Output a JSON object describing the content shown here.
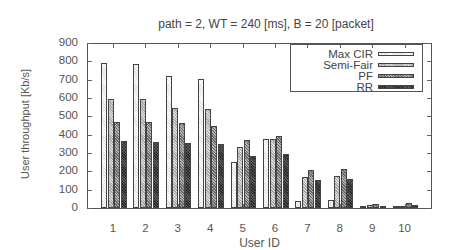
{
  "chart_data": {
    "type": "bar",
    "title": "path = 2, WT = 240 [ms], B = 20 [packet]",
    "xlabel": "User ID",
    "ylabel": "User throughput [Kb/s]",
    "ylim": [
      0,
      900
    ],
    "yticks": [
      0,
      100,
      200,
      300,
      400,
      500,
      600,
      700,
      800,
      900
    ],
    "categories": [
      "1",
      "2",
      "3",
      "4",
      "5",
      "6",
      "7",
      "8",
      "9",
      "10"
    ],
    "legend_position": "upper right",
    "grid": false,
    "series": [
      {
        "name": "Max CIR",
        "values": [
          793,
          783,
          719,
          701,
          250,
          377,
          40,
          43,
          2,
          2
        ]
      },
      {
        "name": "Semi-Fair",
        "values": [
          594,
          594,
          545,
          541,
          335,
          377,
          168,
          174,
          16,
          10
        ]
      },
      {
        "name": "PF",
        "values": [
          469,
          469,
          464,
          449,
          370,
          391,
          210,
          212,
          22,
          25
        ]
      },
      {
        "name": "RR",
        "values": [
          364,
          362,
          352,
          348,
          283,
          295,
          154,
          158,
          12,
          14
        ]
      }
    ]
  }
}
